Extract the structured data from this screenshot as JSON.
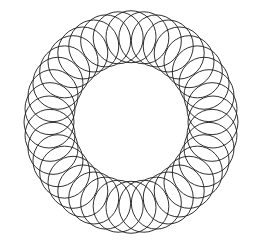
{
  "figure": {
    "background": "#ffffff",
    "stroke_color": "#1a1a1a",
    "center": [
      131,
      122
    ],
    "ring_radius": 82,
    "circle_radius": 25,
    "circle_count": 40,
    "scale_y": 1.04
  }
}
